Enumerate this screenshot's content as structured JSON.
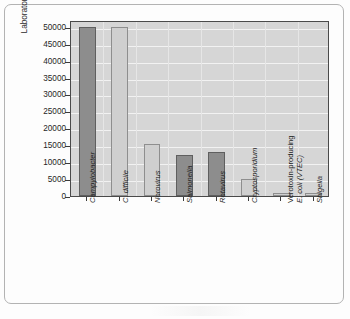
{
  "chart_data": {
    "type": "bar",
    "title": "",
    "xlabel": "",
    "ylabel": "Laboratory reports/year",
    "ylim": [
      0,
      52000
    ],
    "grid": true,
    "legend": "none",
    "orientation": "vertical",
    "categories": [
      "Campylobacter",
      "C. difficile",
      "Norovirus",
      "Salmonella",
      "Rotavirus",
      "Cryptosporidium",
      "Verotoxin-producing E. coli (VTEC)",
      "Shigella"
    ],
    "values": [
      50000,
      50000,
      15500,
      12000,
      13000,
      5000,
      900,
      1000
    ],
    "bar_colors": [
      "dark",
      "light",
      "light",
      "dark",
      "dark",
      "light",
      "light",
      "light"
    ],
    "ytick_labels": [
      "0",
      "5000",
      "10000",
      "15000",
      "20000",
      "25000",
      "30000",
      "35000",
      "40000",
      "45000",
      "50000"
    ],
    "ytick_values": [
      0,
      5000,
      10000,
      15000,
      20000,
      25000,
      30000,
      35000,
      40000,
      45000,
      50000
    ]
  },
  "axis": {
    "y_title": "Laboratory reports/year"
  },
  "x_labels": [
    {
      "line1": "Campylobacter",
      "line2": "",
      "italic": true
    },
    {
      "line1": "C. difficile",
      "line2": "",
      "italic": true
    },
    {
      "line1": "Norovirus",
      "line2": "",
      "italic": true
    },
    {
      "line1": "Salmonella",
      "line2": "",
      "italic": true
    },
    {
      "line1": "Rotavirus",
      "line2": "",
      "italic": true
    },
    {
      "line1": "Cryptosporidium",
      "line2": "",
      "italic": true
    },
    {
      "line1": "Verotoxin-producing",
      "line2": "E. coli (VTEC)",
      "italic": false
    },
    {
      "line1": "Shigella",
      "line2": "",
      "italic": true
    }
  ],
  "colors": {
    "plot_background": "#d6d6d6",
    "gridline": "#f2f2f2",
    "bar_dark": "#8d8d8d",
    "bar_light": "#cfcfcf",
    "axis": "#4a4a4a",
    "frame": "#b3b3b3",
    "text": "#1f1f1f"
  }
}
